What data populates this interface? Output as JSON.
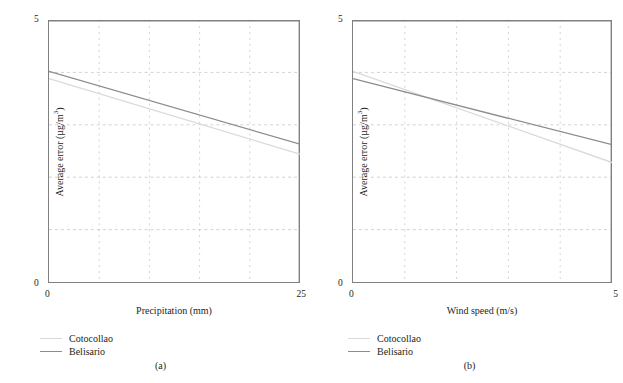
{
  "figure": {
    "background": "#ffffff",
    "series_colors": {
      "Cotocollao": "#d9d9d9",
      "Belisario": "#8c8c8c"
    },
    "axis_color": "#808080",
    "grid_color": "#bfbfbf"
  },
  "panels": [
    {
      "id": "a",
      "subcaption": "(a)",
      "legend": [
        {
          "label": "Cotocollao",
          "color": "#d9d9d9"
        },
        {
          "label": "Belisario",
          "color": "#8c8c8c"
        }
      ],
      "ticks": {
        "y_top": "5",
        "y_bottom": "0",
        "x_left": "0",
        "x_right": "25"
      },
      "chart_data": {
        "type": "line",
        "title": "",
        "xlabel": "Precipitation (mm)",
        "ylabel": "Average error (µg/m³)",
        "xlim": [
          0,
          25
        ],
        "ylim": [
          0,
          5
        ],
        "xticks": [
          0,
          25
        ],
        "yticks": [
          0,
          5
        ],
        "grid": true,
        "grid_x": [
          5,
          10,
          15,
          20
        ],
        "grid_y": [
          1,
          2,
          3,
          4
        ],
        "legend_position": "below-left",
        "series": [
          {
            "name": "Cotocollao",
            "color": "#d9d9d9",
            "x": [
              0,
              25
            ],
            "values": [
              3.88,
              2.44
            ]
          },
          {
            "name": "Belisario",
            "color": "#8c8c8c",
            "x": [
              0,
              25
            ],
            "values": [
              4.02,
              2.63
            ]
          }
        ]
      }
    },
    {
      "id": "b",
      "subcaption": "(b)",
      "legend": [
        {
          "label": "Cotocollao",
          "color": "#d9d9d9"
        },
        {
          "label": "Belisario",
          "color": "#8c8c8c"
        }
      ],
      "ticks": {
        "y_top": "5",
        "y_bottom": "0",
        "x_left": "0",
        "x_right": "5"
      },
      "chart_data": {
        "type": "line",
        "title": "",
        "xlabel": "Wind speed (m/s)",
        "ylabel": "Average error (µg/m³)",
        "xlim": [
          0,
          5
        ],
        "ylim": [
          0,
          5
        ],
        "xticks": [
          0,
          5
        ],
        "yticks": [
          0,
          5
        ],
        "grid": true,
        "grid_x": [
          1,
          2,
          3,
          4
        ],
        "grid_y": [
          1,
          2,
          3,
          4
        ],
        "legend_position": "below-left",
        "series": [
          {
            "name": "Cotocollao",
            "color": "#d9d9d9",
            "x": [
              0,
              5
            ],
            "values": [
              4.02,
              2.28
            ]
          },
          {
            "name": "Belisario",
            "color": "#8c8c8c",
            "x": [
              0,
              5
            ],
            "values": [
              3.88,
              2.62
            ]
          }
        ]
      }
    }
  ]
}
